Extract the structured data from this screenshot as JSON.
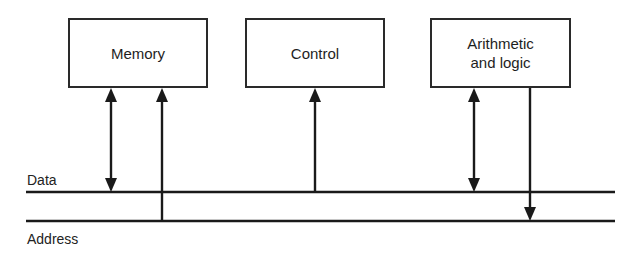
{
  "diagram": {
    "units": [
      {
        "id": "memory",
        "label": "Memory"
      },
      {
        "id": "control",
        "label": "Control"
      },
      {
        "id": "alu",
        "label_line1": "Arithmetic",
        "label_line2": "and logic"
      }
    ],
    "buses": [
      {
        "id": "data",
        "label": "Data"
      },
      {
        "id": "address",
        "label": "Address"
      }
    ],
    "connections": [
      {
        "from": "memory",
        "to": "data",
        "direction": "bidirectional"
      },
      {
        "from": "address",
        "to": "memory",
        "direction": "to-unit"
      },
      {
        "from": "data",
        "to": "control",
        "direction": "to-unit"
      },
      {
        "from": "alu",
        "to": "data",
        "direction": "bidirectional"
      },
      {
        "from": "alu",
        "to": "address",
        "direction": "to-bus"
      }
    ],
    "colors": {
      "stroke": "#1a1a1a",
      "background": "#ffffff"
    }
  }
}
